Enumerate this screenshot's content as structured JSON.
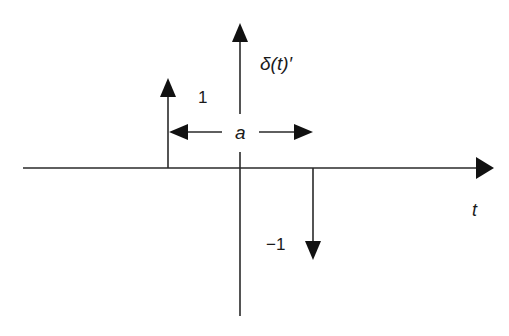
{
  "diagram": {
    "labels": {
      "function": "δ(t)′",
      "positive_amplitude": "1",
      "negative_amplitude": "−1",
      "spacing": "a",
      "time_axis": "t"
    },
    "impulses": [
      {
        "position": "left",
        "amplitude": 1,
        "direction": "up"
      },
      {
        "position": "right",
        "amplitude": -1,
        "direction": "down"
      }
    ],
    "colors": {
      "stroke": "#2a2a2a",
      "background": "#ffffff"
    }
  }
}
